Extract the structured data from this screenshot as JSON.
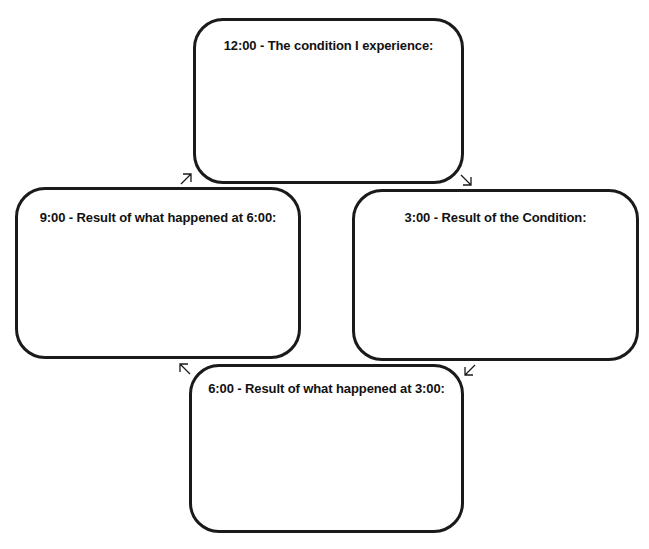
{
  "diagram": {
    "type": "cycle",
    "boxes": [
      {
        "position": "top",
        "label": "12:00 - The condition I experience:"
      },
      {
        "position": "right",
        "label": "3:00 - Result of the Condition:"
      },
      {
        "position": "bottom",
        "label": "6:00 - Result of what happened at 3:00:"
      },
      {
        "position": "left",
        "label": "9:00 - Result of what happened at 6:00:"
      }
    ],
    "arrows": [
      {
        "from": "top",
        "to": "right",
        "direction": "south-east"
      },
      {
        "from": "right",
        "to": "bottom",
        "direction": "south-west"
      },
      {
        "from": "bottom",
        "to": "left",
        "direction": "north-west"
      },
      {
        "from": "left",
        "to": "top",
        "direction": "north-east"
      }
    ],
    "colors": {
      "stroke": "#1a1a1a",
      "background": "#ffffff",
      "text": "#111111"
    }
  }
}
